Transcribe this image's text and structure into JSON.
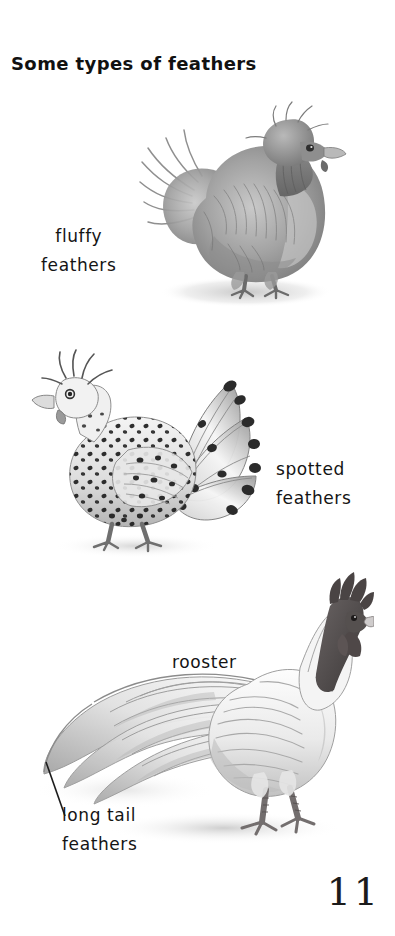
{
  "page": {
    "title": "Some types of feathers",
    "page_number": "11",
    "background_color": "#ffffff",
    "text_color": "#141414"
  },
  "labels": {
    "fluffy_line1": "fluffy",
    "fluffy_line2": "feathers",
    "spotted_line1": "spotted",
    "spotted_line2": "feathers",
    "rooster": "rooster",
    "long_tail_line1": "long tail",
    "long_tail_line2": "feathers"
  },
  "illustrations": [
    {
      "name": "silkie-chicken",
      "alt": "Fluffy silkie chicken with puffed crest and soft downy plumage",
      "medium": "graphite pencil drawing",
      "palette": [
        "#8d8d8d",
        "#b5b5b5",
        "#6e6e6e",
        "#d8d8d8"
      ]
    },
    {
      "name": "spotted-hen",
      "alt": "Crested hen with black speckled body and spotted fan tail",
      "medium": "graphite pencil drawing",
      "palette": [
        "#2a2a2a",
        "#ededed",
        "#9a9a9a",
        "#5a5a5a"
      ]
    },
    {
      "name": "long-tailed-rooster",
      "alt": "White rooster with dark comb and wattles and long sweeping tail feathers",
      "medium": "graphite pencil drawing",
      "palette": [
        "#4a4545",
        "#f2f2f2",
        "#b9b9b9",
        "#6f6a6a"
      ]
    }
  ]
}
